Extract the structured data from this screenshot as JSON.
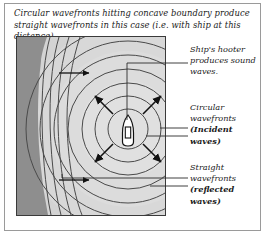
{
  "caption": "Circular wavefronts hitting concave boundary produce straight wavefronts in this case (i.e. with ship at this distance).",
  "notes": {
    "hooter": "Ship's hooter produces sound waves.",
    "incident_lead": "Circular wavefronts",
    "incident_bold": "(Incident waves)",
    "reflected_lead": "Straight wavefronts",
    "reflected_bold": "(reflected waves)"
  },
  "diagram": {
    "land_label": "concave-boundary-land-mass",
    "water_label": "water-area",
    "ship_label": "ship",
    "ship_x": 111,
    "ship_y": 92,
    "incident_circle_radii": [
      20,
      33,
      46,
      60,
      74,
      88,
      102
    ],
    "reflected_wavefront_count": 4,
    "radiating_arrow_count": 4,
    "reflected_arrow_count": 2,
    "reflected_arrow_direction": "right"
  },
  "colors": {
    "frame_border": "#9a9a9a",
    "panel_border": "#3a3a3a",
    "land_dark": "#8e8e8e",
    "water_light": "#d6d6d6",
    "water_mid": "#cbcbcb",
    "wave_line": "#4a4a4a",
    "arrow": "#111111",
    "ship_body": "#ffffff",
    "ship_outline": "#111111",
    "text": "#1a1a1a",
    "page_bg": "#ffffff"
  }
}
